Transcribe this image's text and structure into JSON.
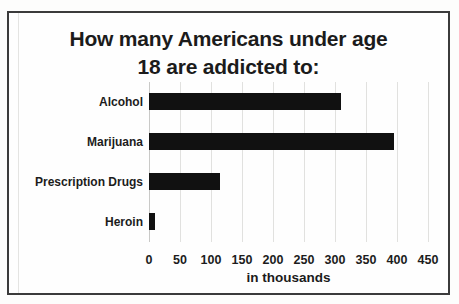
{
  "page": {
    "background": "#ffffff"
  },
  "chart": {
    "frame_border_color": "#3b3b3b",
    "bar_color": "#111111",
    "gridline_color": "#e1e1df",
    "text_color": "#1c1c1c"
  },
  "chart_data": {
    "type": "bar",
    "orientation": "horizontal",
    "title": "How many Americans under age 18 are addicted to:",
    "title_lines": [
      "How many Americans under age",
      "18 are addicted to:"
    ],
    "categories": [
      "Alcohol",
      "Marijuana",
      "Prescription Drugs",
      "Heroin"
    ],
    "values": [
      310,
      395,
      115,
      10
    ],
    "xlabel": "in thousands",
    "ylabel": "",
    "xlim": [
      0,
      450
    ],
    "xticks": [
      0,
      50,
      100,
      150,
      200,
      250,
      300,
      350,
      400,
      450
    ],
    "grid": true,
    "legend": false,
    "units": "thousands"
  }
}
